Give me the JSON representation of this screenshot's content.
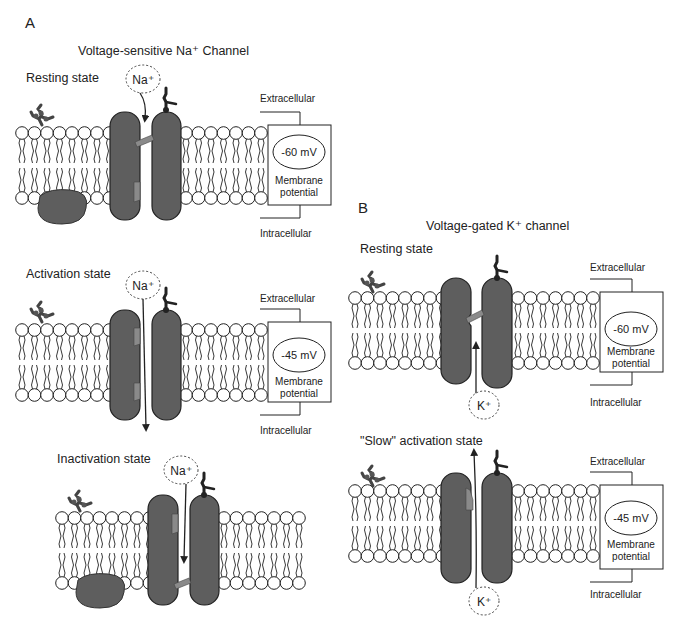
{
  "panel_a": {
    "letter": "A",
    "title": "Voltage-sensitive Na⁺ Channel",
    "states": [
      {
        "label": "Resting state",
        "ion": "Na⁺",
        "voltage": "-60 mV",
        "potential_label_1": "Membrane",
        "potential_label_2": "potential",
        "extracellular": "Extracellular",
        "intracellular": "Intracellular"
      },
      {
        "label": "Activation state",
        "ion": "Na⁺",
        "voltage": "-45 mV",
        "potential_label_1": "Membrane",
        "potential_label_2": "potential",
        "extracellular": "Extracellular",
        "intracellular": "Intracellular"
      },
      {
        "label": "Inactivation state",
        "ion": "Na⁺"
      }
    ]
  },
  "panel_b": {
    "letter": "B",
    "title": "Voltage-gated K⁺ channel",
    "states": [
      {
        "label": "Resting state",
        "ion": "K⁺",
        "voltage": "-60 mV",
        "potential_label_1": "Membrane",
        "potential_label_2": "potential",
        "extracellular": "Extracellular",
        "intracellular": "Intracellular"
      },
      {
        "label": "\"Slow\" activation state",
        "ion": "K⁺",
        "voltage": "-45 mV",
        "potential_label_1": "Membrane",
        "potential_label_2": "potential",
        "extracellular": "Extracellular",
        "intracellular": "Intracellular"
      }
    ]
  },
  "colors": {
    "protein": "#5e5e5e",
    "gate": "#8a8a8a",
    "line": "#222222"
  }
}
